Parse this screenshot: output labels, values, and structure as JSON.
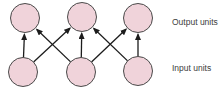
{
  "diagram": {
    "type": "neural-network-layer-diagram",
    "canvas": {
      "width": 223,
      "height": 90,
      "background": "#ffffff"
    },
    "colors": {
      "node_fill": "#f0d3da",
      "node_stroke": "#4a4a4a",
      "arrow": "#1c1c1c",
      "label": "#3d3d3d"
    },
    "node_radius": 14.5,
    "layers": {
      "output": {
        "name": "output",
        "nodes": [
          {
            "x": 25,
            "y": 18
          },
          {
            "x": 82,
            "y": 17
          },
          {
            "x": 138,
            "y": 18
          }
        ]
      },
      "input": {
        "name": "input",
        "nodes": [
          {
            "x": 23,
            "y": 72
          },
          {
            "x": 81,
            "y": 72
          },
          {
            "x": 138,
            "y": 71
          }
        ]
      }
    },
    "connections": [
      {
        "from": 0,
        "to": 0
      },
      {
        "from": 0,
        "to": 1
      },
      {
        "from": 1,
        "to": 0
      },
      {
        "from": 1,
        "to": 1
      },
      {
        "from": 1,
        "to": 2
      },
      {
        "from": 2,
        "to": 1
      },
      {
        "from": 2,
        "to": 2
      }
    ],
    "labels": {
      "output": {
        "text": "Output units"
      },
      "input": {
        "text": "Input units"
      }
    }
  }
}
